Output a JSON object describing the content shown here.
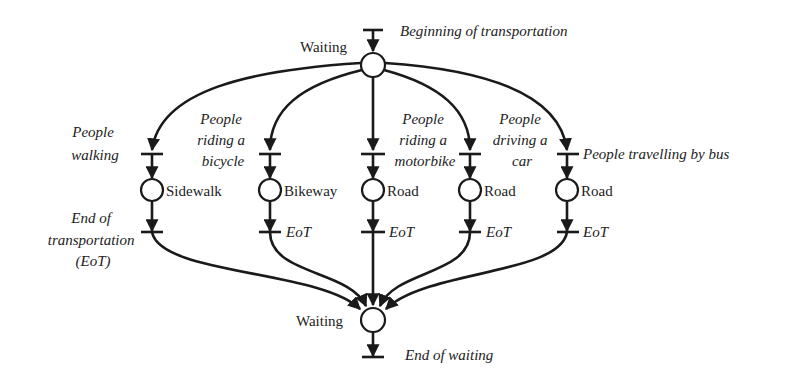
{
  "diagram": {
    "type": "petri-net",
    "top": {
      "transition_label": "Beginning of transportation",
      "place_label": "Waiting"
    },
    "bottom": {
      "place_label": "Waiting",
      "transition_label": "End of waiting"
    },
    "branches": [
      {
        "start_label_lines": [
          "People",
          "walking"
        ],
        "place_label": "Sidewalk",
        "end_label_lines": [
          "End of",
          "transportation",
          "(EoT)"
        ]
      },
      {
        "start_label_lines": [
          "People",
          "riding a",
          "bicycle"
        ],
        "place_label": "Bikeway",
        "end_label_lines": [
          "EoT"
        ]
      },
      {
        "start_label_lines": [
          "People",
          "riding a",
          "motorbike"
        ],
        "place_label": "Road",
        "end_label_lines": [
          "EoT"
        ]
      },
      {
        "start_label_lines": [
          "People",
          "driving a",
          "car"
        ],
        "place_label": "Road",
        "end_label_lines": [
          "EoT"
        ]
      },
      {
        "start_label_lines": [
          "People travelling by bus"
        ],
        "place_label": "Road",
        "end_label_lines": [
          "EoT"
        ]
      }
    ]
  }
}
